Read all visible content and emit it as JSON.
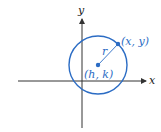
{
  "diagram": {
    "title": "",
    "colors": {
      "circle": "#2b6cc4",
      "axes": "#333333",
      "radius_line": "#2b6cc4",
      "labels": "#2b6cc4",
      "axis_labels": "#222222"
    },
    "axes": {
      "x_label": "x",
      "y_label": "y"
    },
    "circle": {
      "center_label": "(h, k)",
      "point_label": "(x, y)",
      "radius_label": "r"
    }
  }
}
